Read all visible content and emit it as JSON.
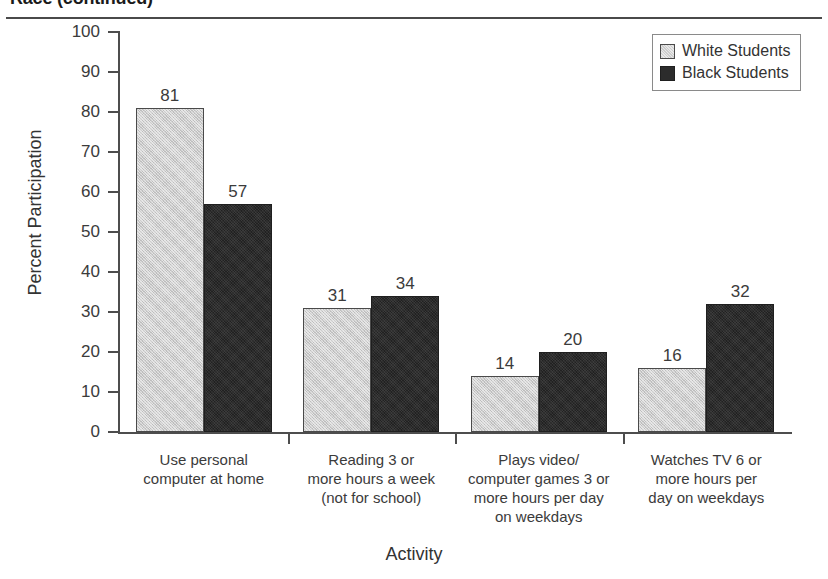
{
  "page": {
    "header_title": "Race (continued)"
  },
  "chart_data": {
    "type": "bar",
    "title": "Race (continued)",
    "xlabel": "Activity",
    "ylabel": "Percent Participation",
    "ylim": [
      0,
      100
    ],
    "ytick_step": 10,
    "yticks": [
      "100",
      "90",
      "80",
      "70",
      "60",
      "50",
      "40",
      "30",
      "20",
      "10",
      "0"
    ],
    "grid": false,
    "legend_position": "top-right",
    "categories": [
      "Use personal\ncomputer at home",
      "Reading 3 or\nmore hours a week\n(not for school)",
      "Plays video/\ncomputer games 3 or\nmore hours per day\non weekdays",
      "Watches TV 6 or\nmore hours per\nday on weekdays"
    ],
    "category_lines": [
      [
        "Use personal",
        "computer at home"
      ],
      [
        "Reading 3 or",
        "more hours a week",
        "(not for school)"
      ],
      [
        "Plays video/",
        "computer games 3 or",
        "more hours per day",
        "on weekdays"
      ],
      [
        "Watches TV 6 or",
        "more hours per",
        "day on weekdays"
      ]
    ],
    "series": [
      {
        "name": "White Students",
        "color": "#cdcdcd",
        "values": [
          81,
          31,
          14,
          16
        ],
        "labels": [
          "81",
          "31",
          "14",
          "16"
        ]
      },
      {
        "name": "Black Students",
        "color": "#2c2c2c",
        "values": [
          57,
          34,
          20,
          32
        ],
        "labels": [
          "57",
          "34",
          "20",
          "32"
        ]
      }
    ]
  },
  "legend": {
    "entries": [
      {
        "label": "White Students",
        "swatch": "white-series"
      },
      {
        "label": "Black Students",
        "swatch": "black-series"
      }
    ]
  }
}
